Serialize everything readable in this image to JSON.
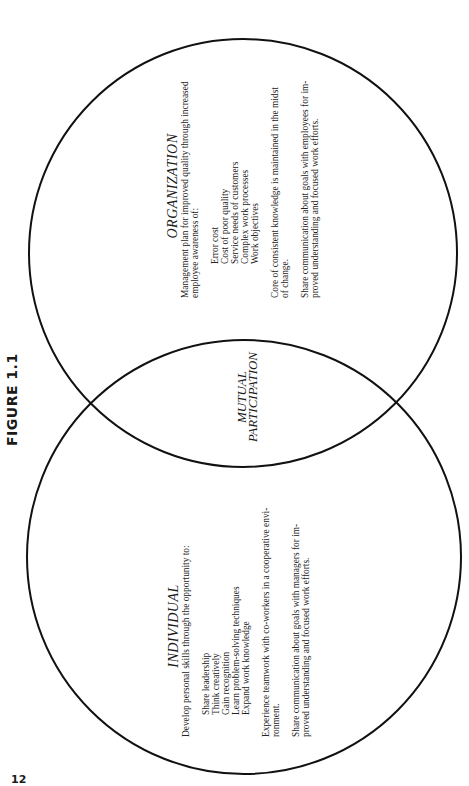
{
  "figure": {
    "label": "FIGURE 1.1",
    "page_number": "12"
  },
  "diagram": {
    "type": "venn",
    "circles": [
      {
        "id": "organization",
        "cx": 243,
        "cy": 253,
        "r": 214
      },
      {
        "id": "individual",
        "cx": 244,
        "cy": 557,
        "r": 217
      }
    ],
    "stroke_color": "#111111"
  },
  "organization": {
    "heading": "ORGANIZATION",
    "intro_line1": "Management plan for improved quality through increased",
    "intro_line2": "employee awareness of:",
    "items": [
      "Error cost",
      "Cost of poor quality",
      "Service needs of customers",
      "Complex work processes",
      "Work objectives"
    ],
    "core_line1": "Core of consistent knowledge is maintained in the midst",
    "core_line2": "of change.",
    "share_line1": "Share communication about goals with employees for im-",
    "share_line2": "proved understanding and focused work efforts."
  },
  "overlap": {
    "line1": "MUTUAL",
    "line2": "PARTICIPATION"
  },
  "individual": {
    "heading": "INDIVIDUAL",
    "intro_line1": "Develop personal skills through the opportunity to:",
    "items": [
      "Share leadership",
      "Think creatively",
      "Gain recognition",
      "Learn problem-solving techniques",
      "Expand work knowledge"
    ],
    "experience_line1": "Experience teamwork with co-workers in a cooperative envi-",
    "experience_line2": "ronment.",
    "share_line1": "Share communication about goals with managers for im-",
    "share_line2": "proved understanding and focused work efforts."
  }
}
